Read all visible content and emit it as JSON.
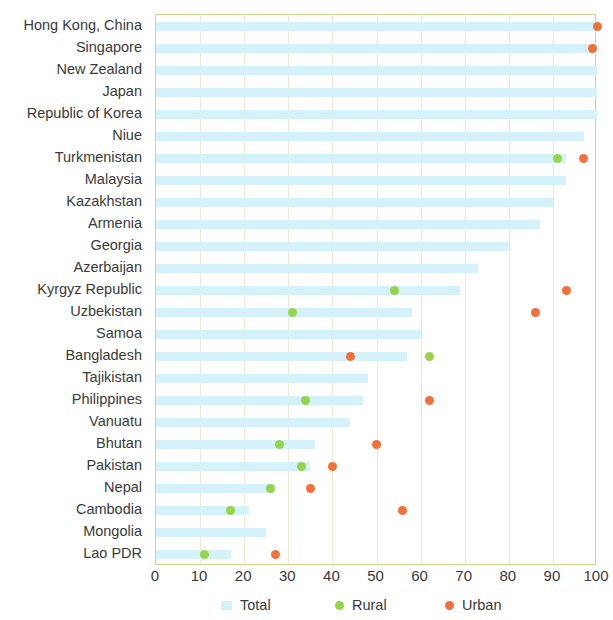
{
  "chart_data": {
    "type": "bar",
    "title": "",
    "subtitle": "",
    "xlabel": "",
    "ylabel": "",
    "xlim": [
      0,
      100
    ],
    "xticks": [
      0,
      10,
      20,
      30,
      40,
      50,
      60,
      70,
      80,
      90,
      100
    ],
    "grid": true,
    "legend_position": "bottom",
    "orientation": "horizontal",
    "colors": {
      "total": "#d5f1fa",
      "rural": "#96d44a",
      "urban": "#f0713c",
      "axis": "#c8d98a",
      "gridline": "#efe7cf",
      "text": "#3a3a3a"
    },
    "legend": [
      {
        "label": "Total",
        "marker": "square",
        "color": "#d5f1fa"
      },
      {
        "label": "Rural",
        "marker": "circle",
        "color": "#96d44a"
      },
      {
        "label": "Urban",
        "marker": "circle",
        "color": "#f0713c"
      }
    ],
    "categories": [
      "Hong Kong, China",
      "Singapore",
      "New Zealand",
      "Japan",
      "Republic of Korea",
      "Niue",
      "Turkmenistan",
      "Malaysia",
      "Kazakhstan",
      "Armenia",
      "Georgia",
      "Azerbaijan",
      "Kyrgyz Republic",
      "Uzbekistan",
      "Samoa",
      "Bangladesh",
      "Tajikistan",
      "Philippines",
      "Vanuatu",
      "Bhutan",
      "Pakistan",
      "Nepal",
      "Cambodia",
      "Mongolia",
      "Lao PDR"
    ],
    "series": [
      {
        "name": "Total",
        "values": [
          100,
          100,
          100,
          100,
          100,
          97,
          93,
          93,
          90,
          87,
          80,
          73,
          69,
          58,
          60,
          57,
          48,
          47,
          44,
          36,
          35,
          27,
          21,
          25,
          17
        ]
      },
      {
        "name": "Rural",
        "values": [
          null,
          null,
          null,
          null,
          null,
          null,
          91,
          null,
          null,
          null,
          null,
          null,
          54,
          31,
          null,
          62,
          null,
          34,
          null,
          28,
          33,
          26,
          17,
          null,
          11
        ]
      },
      {
        "name": "Urban",
        "values": [
          100,
          99,
          null,
          null,
          null,
          null,
          97,
          null,
          null,
          null,
          null,
          null,
          93,
          86,
          null,
          44,
          null,
          62,
          null,
          50,
          40,
          35,
          56,
          null,
          27
        ]
      }
    ]
  }
}
